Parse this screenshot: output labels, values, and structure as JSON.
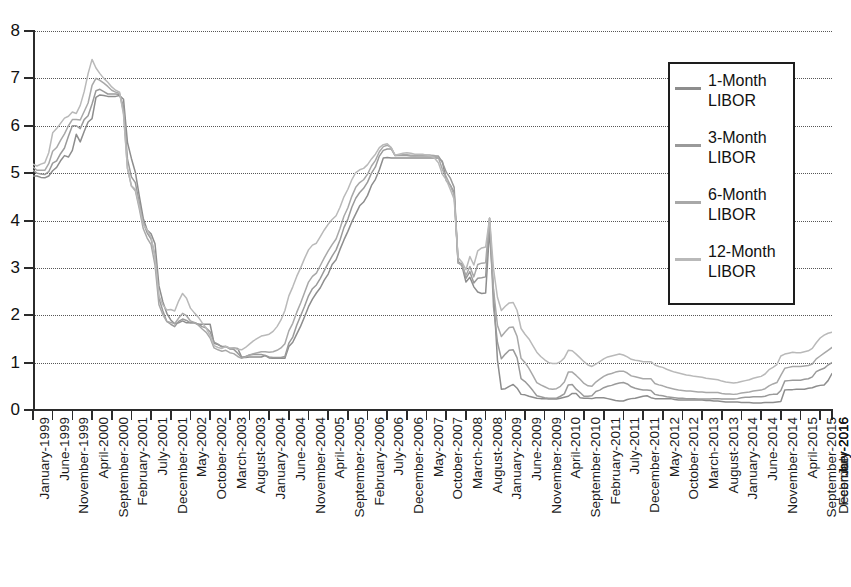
{
  "chart_data": {
    "type": "line",
    "title": "",
    "xlabel": "",
    "ylabel": "",
    "ylim": [
      0,
      8
    ],
    "yticks": [
      "0",
      "1",
      "2",
      "3",
      "4",
      "5",
      "6",
      "7",
      "8"
    ],
    "grid": true,
    "legend_position": "upper-right",
    "x_start": "January-1999",
    "x_end": "December-2016",
    "x_tick_interval_months": 5,
    "tick_labels": [
      "January-1999",
      "June-1999",
      "November-1999",
      "April-2000",
      "September-2000",
      "February-2001",
      "July-2001",
      "December-2001",
      "May-2002",
      "October-2002",
      "March-2003",
      "August-2003",
      "January-2004",
      "June-2004",
      "November-2004",
      "April-2005",
      "September-2005",
      "February-2006",
      "July-2006",
      "December-2006",
      "May-2007",
      "October-2007",
      "March-2008",
      "August-2008",
      "January-2009",
      "June-2009",
      "November-2009",
      "April-2010",
      "September-2010",
      "February-2011",
      "July-2011",
      "December-2011",
      "May-2012",
      "October-2012",
      "March-2013",
      "August-2013",
      "January-2014",
      "June-2014",
      "November-2014",
      "April-2015",
      "September-2015",
      "February-2016",
      "July-2016",
      "December-2016"
    ],
    "series": [
      {
        "name": "1-Month LIBOR",
        "color": "#8d8d8d",
        "values": [
          4.94,
          4.94,
          4.91,
          4.9,
          4.94,
          5.05,
          5.12,
          5.26,
          5.37,
          5.34,
          5.48,
          5.82,
          5.66,
          5.88,
          6.08,
          6.15,
          6.6,
          6.65,
          6.64,
          6.62,
          6.62,
          6.62,
          6.64,
          6.56,
          5.65,
          5.31,
          5.02,
          4.52,
          4.05,
          3.8,
          3.72,
          3.51,
          2.62,
          2.28,
          2.04,
          1.9,
          1.82,
          1.84,
          1.88,
          1.84,
          1.84,
          1.84,
          1.81,
          1.81,
          1.81,
          1.81,
          1.41,
          1.38,
          1.34,
          1.34,
          1.3,
          1.31,
          1.3,
          1.12,
          1.11,
          1.12,
          1.12,
          1.12,
          1.12,
          1.15,
          1.1,
          1.09,
          1.09,
          1.1,
          1.09,
          1.34,
          1.43,
          1.6,
          1.77,
          1.97,
          2.18,
          2.34,
          2.47,
          2.58,
          2.74,
          2.87,
          3.07,
          3.17,
          3.39,
          3.59,
          3.77,
          3.97,
          4.14,
          4.31,
          4.39,
          4.53,
          4.74,
          4.87,
          5.07,
          5.32,
          5.33,
          5.32,
          5.32,
          5.32,
          5.32,
          5.32,
          5.32,
          5.32,
          5.32,
          5.32,
          5.32,
          5.32,
          5.32,
          5.32,
          5.25,
          4.84,
          4.75,
          4.59,
          3.14,
          3.04,
          2.7,
          2.8,
          2.6,
          2.49,
          2.46,
          2.47,
          3.8,
          2.49,
          1.06,
          0.44,
          0.45,
          0.5,
          0.54,
          0.46,
          0.33,
          0.32,
          0.29,
          0.27,
          0.25,
          0.24,
          0.24,
          0.23,
          0.23,
          0.23,
          0.25,
          0.27,
          0.29,
          0.35,
          0.35,
          0.26,
          0.25,
          0.25,
          0.24,
          0.26,
          0.26,
          0.26,
          0.24,
          0.22,
          0.2,
          0.19,
          0.19,
          0.22,
          0.24,
          0.25,
          0.27,
          0.29,
          0.3,
          0.26,
          0.24,
          0.24,
          0.24,
          0.24,
          0.24,
          0.22,
          0.21,
          0.21,
          0.21,
          0.21,
          0.21,
          0.21,
          0.21,
          0.2,
          0.2,
          0.19,
          0.19,
          0.18,
          0.17,
          0.17,
          0.17,
          0.17,
          0.16,
          0.16,
          0.16,
          0.15,
          0.15,
          0.15,
          0.16,
          0.16,
          0.16,
          0.17,
          0.18,
          0.42,
          0.43,
          0.43,
          0.44,
          0.44,
          0.44,
          0.46,
          0.47,
          0.5,
          0.52,
          0.53,
          0.62,
          0.77
        ]
      },
      {
        "name": "3-Month LIBOR",
        "color": "#9a9a9a",
        "values": [
          5.06,
          5.0,
          4.98,
          4.97,
          5.03,
          5.21,
          5.26,
          5.41,
          5.53,
          5.78,
          6.0,
          6.0,
          5.94,
          6.13,
          6.21,
          6.46,
          6.74,
          6.77,
          6.72,
          6.67,
          6.67,
          6.67,
          6.66,
          6.4,
          5.3,
          4.92,
          4.8,
          4.37,
          3.96,
          3.74,
          3.61,
          3.26,
          2.36,
          2.09,
          1.87,
          1.81,
          1.76,
          1.87,
          1.92,
          1.89,
          1.84,
          1.84,
          1.81,
          1.76,
          1.73,
          1.65,
          1.43,
          1.39,
          1.33,
          1.34,
          1.29,
          1.28,
          1.2,
          1.11,
          1.13,
          1.16,
          1.17,
          1.17,
          1.17,
          1.15,
          1.12,
          1.11,
          1.11,
          1.11,
          1.13,
          1.41,
          1.54,
          1.79,
          1.99,
          2.19,
          2.41,
          2.56,
          2.64,
          2.78,
          2.94,
          3.1,
          3.25,
          3.38,
          3.59,
          3.85,
          4.03,
          4.28,
          4.47,
          4.59,
          4.68,
          4.81,
          5.0,
          5.13,
          5.36,
          5.48,
          5.51,
          5.51,
          5.37,
          5.37,
          5.37,
          5.37,
          5.36,
          5.36,
          5.36,
          5.36,
          5.36,
          5.36,
          5.36,
          5.36,
          5.23,
          5.02,
          4.9,
          4.7,
          3.11,
          3.09,
          2.78,
          2.92,
          2.68,
          2.78,
          2.79,
          2.81,
          4.05,
          2.18,
          1.43,
          1.08,
          1.18,
          1.26,
          1.27,
          1.1,
          0.66,
          0.6,
          0.51,
          0.41,
          0.3,
          0.28,
          0.26,
          0.25,
          0.25,
          0.25,
          0.29,
          0.34,
          0.53,
          0.54,
          0.44,
          0.37,
          0.29,
          0.29,
          0.3,
          0.39,
          0.42,
          0.47,
          0.5,
          0.52,
          0.55,
          0.57,
          0.58,
          0.55,
          0.49,
          0.46,
          0.44,
          0.42,
          0.42,
          0.41,
          0.33,
          0.31,
          0.3,
          0.28,
          0.27,
          0.26,
          0.25,
          0.25,
          0.24,
          0.24,
          0.24,
          0.23,
          0.23,
          0.23,
          0.23,
          0.24,
          0.24,
          0.23,
          0.23,
          0.23,
          0.23,
          0.24,
          0.26,
          0.27,
          0.27,
          0.28,
          0.28,
          0.28,
          0.29,
          0.32,
          0.33,
          0.33,
          0.41,
          0.61,
          0.62,
          0.63,
          0.63,
          0.63,
          0.65,
          0.66,
          0.7,
          0.81,
          0.85,
          0.88,
          0.95,
          1.0
        ]
      },
      {
        "name": "6-Month LIBOR",
        "color": "#a8a8a8",
        "values": [
          5.13,
          5.06,
          5.06,
          5.06,
          5.2,
          5.46,
          5.54,
          5.69,
          5.83,
          6.0,
          6.13,
          6.13,
          6.12,
          6.3,
          6.48,
          6.85,
          7.0,
          6.96,
          6.9,
          6.83,
          6.75,
          6.71,
          6.68,
          6.3,
          5.1,
          4.73,
          4.63,
          4.25,
          3.83,
          3.63,
          3.49,
          3.06,
          2.22,
          2.01,
          1.87,
          1.85,
          1.82,
          1.94,
          2.04,
          1.99,
          1.88,
          1.85,
          1.79,
          1.71,
          1.64,
          1.52,
          1.31,
          1.27,
          1.24,
          1.26,
          1.21,
          1.19,
          1.13,
          1.09,
          1.12,
          1.16,
          1.19,
          1.21,
          1.23,
          1.23,
          1.22,
          1.23,
          1.26,
          1.31,
          1.4,
          1.67,
          1.83,
          2.06,
          2.26,
          2.48,
          2.7,
          2.82,
          2.89,
          3.05,
          3.21,
          3.36,
          3.49,
          3.61,
          3.83,
          4.09,
          4.27,
          4.51,
          4.7,
          4.8,
          4.86,
          4.98,
          5.15,
          5.27,
          5.45,
          5.56,
          5.59,
          5.54,
          5.37,
          5.38,
          5.39,
          5.39,
          5.38,
          5.37,
          5.38,
          5.38,
          5.38,
          5.38,
          5.37,
          5.33,
          5.08,
          4.92,
          4.75,
          4.54,
          3.1,
          3.06,
          2.84,
          3.03,
          2.81,
          3.07,
          3.1,
          3.11,
          4.05,
          2.54,
          1.79,
          1.55,
          1.65,
          1.74,
          1.75,
          1.55,
          1.09,
          1.0,
          0.88,
          0.73,
          0.58,
          0.53,
          0.49,
          0.45,
          0.44,
          0.45,
          0.5,
          0.59,
          0.8,
          0.8,
          0.73,
          0.65,
          0.56,
          0.51,
          0.5,
          0.59,
          0.65,
          0.71,
          0.75,
          0.77,
          0.8,
          0.82,
          0.82,
          0.78,
          0.72,
          0.7,
          0.68,
          0.66,
          0.66,
          0.66,
          0.56,
          0.53,
          0.51,
          0.48,
          0.46,
          0.44,
          0.42,
          0.41,
          0.4,
          0.4,
          0.39,
          0.38,
          0.38,
          0.37,
          0.37,
          0.37,
          0.37,
          0.35,
          0.34,
          0.34,
          0.33,
          0.34,
          0.36,
          0.37,
          0.38,
          0.4,
          0.41,
          0.42,
          0.45,
          0.51,
          0.55,
          0.58,
          0.73,
          0.88,
          0.9,
          0.92,
          0.92,
          0.92,
          0.93,
          0.94,
          0.97,
          1.08,
          1.14,
          1.2,
          1.26,
          1.32
        ]
      },
      {
        "name": "12-Month LIBOR",
        "color": "#b9b9b9",
        "values": [
          5.19,
          5.15,
          5.19,
          5.22,
          5.43,
          5.85,
          5.94,
          6.05,
          6.16,
          6.2,
          6.29,
          6.26,
          6.43,
          6.72,
          7.1,
          7.4,
          7.22,
          7.1,
          7.0,
          6.92,
          6.82,
          6.75,
          6.71,
          6.23,
          5.1,
          4.73,
          4.66,
          4.31,
          3.92,
          3.8,
          3.65,
          3.22,
          2.41,
          2.22,
          2.11,
          2.12,
          2.09,
          2.3,
          2.46,
          2.36,
          2.15,
          2.05,
          1.96,
          1.84,
          1.73,
          1.57,
          1.36,
          1.32,
          1.3,
          1.34,
          1.31,
          1.31,
          1.28,
          1.27,
          1.32,
          1.39,
          1.46,
          1.51,
          1.56,
          1.58,
          1.6,
          1.66,
          1.76,
          1.9,
          2.1,
          2.41,
          2.6,
          2.82,
          3.0,
          3.2,
          3.38,
          3.48,
          3.52,
          3.66,
          3.8,
          3.92,
          4.02,
          4.1,
          4.28,
          4.5,
          4.66,
          4.86,
          5.01,
          5.07,
          5.1,
          5.18,
          5.3,
          5.4,
          5.54,
          5.6,
          5.62,
          5.54,
          5.38,
          5.4,
          5.42,
          5.43,
          5.42,
          5.4,
          5.4,
          5.4,
          5.38,
          5.36,
          5.32,
          5.22,
          4.98,
          4.86,
          4.66,
          4.45,
          3.22,
          3.12,
          2.96,
          3.24,
          3.06,
          3.36,
          3.42,
          3.44,
          4.05,
          2.98,
          2.38,
          2.1,
          2.19,
          2.26,
          2.27,
          2.1,
          1.72,
          1.6,
          1.5,
          1.36,
          1.22,
          1.13,
          1.06,
          1.0,
          0.98,
          0.98,
          1.02,
          1.1,
          1.26,
          1.25,
          1.18,
          1.1,
          1.02,
          0.95,
          0.92,
          0.97,
          1.02,
          1.08,
          1.12,
          1.14,
          1.16,
          1.18,
          1.16,
          1.12,
          1.07,
          1.05,
          1.04,
          1.02,
          1.02,
          1.02,
          0.95,
          0.92,
          0.9,
          0.86,
          0.83,
          0.8,
          0.78,
          0.76,
          0.74,
          0.73,
          0.71,
          0.7,
          0.69,
          0.67,
          0.66,
          0.65,
          0.64,
          0.61,
          0.59,
          0.58,
          0.57,
          0.58,
          0.6,
          0.62,
          0.64,
          0.67,
          0.69,
          0.71,
          0.76,
          0.85,
          0.9,
          0.96,
          1.14,
          1.18,
          1.2,
          1.22,
          1.21,
          1.21,
          1.23,
          1.25,
          1.3,
          1.42,
          1.52,
          1.58,
          1.62,
          1.64
        ]
      }
    ]
  },
  "legend": {
    "items": [
      {
        "label": "1-Month\nLIBOR",
        "line1": "1-Month",
        "line2": "LIBOR",
        "color": "#8d8d8d"
      },
      {
        "label": "3-Month\nLIBOR",
        "line1": "3-Month",
        "line2": "LIBOR",
        "color": "#9a9a9a"
      },
      {
        "label": "6-Month\nLIBOR",
        "line1": "6-Month",
        "line2": "LIBOR",
        "color": "#a8a8a8"
      },
      {
        "label": "12-Month\nLIBOR",
        "line1": "12-Month",
        "line2": "LIBOR",
        "color": "#b9b9b9"
      }
    ]
  }
}
